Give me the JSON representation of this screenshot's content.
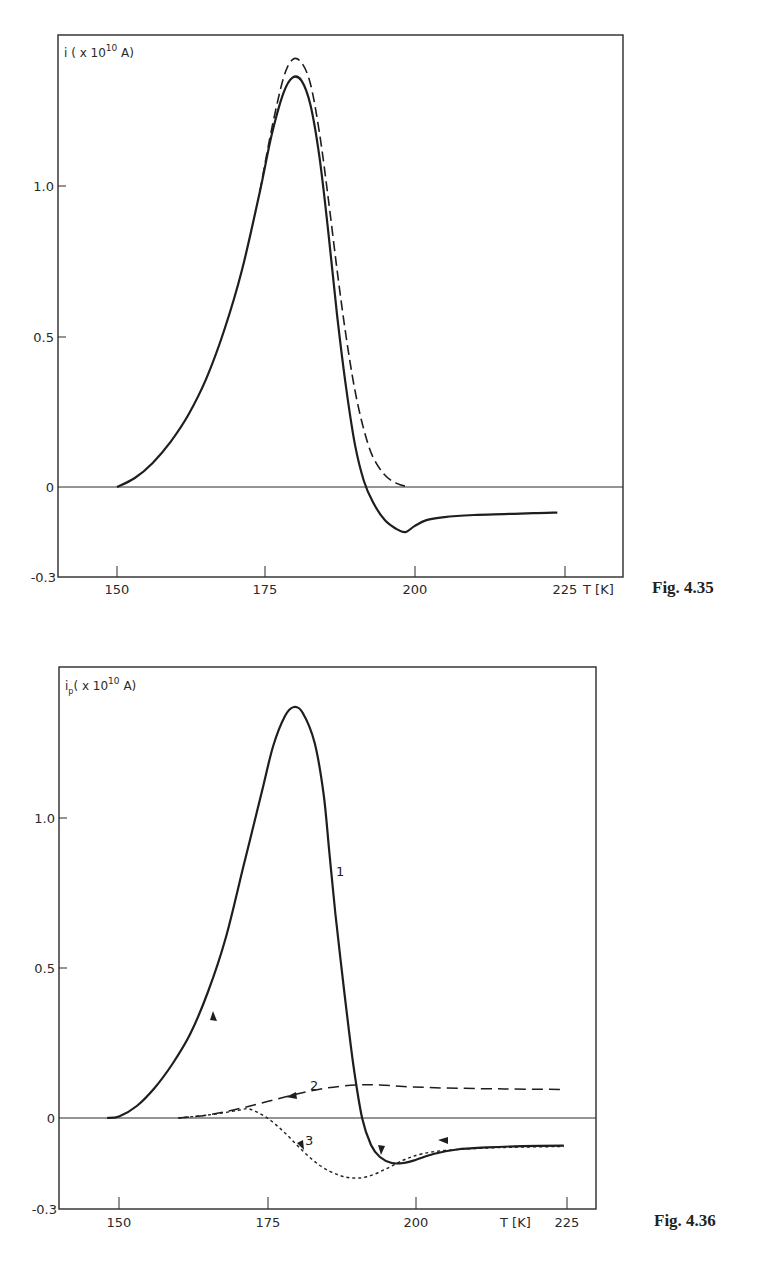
{
  "colors": {
    "ink": "#2a2a2a",
    "background": "#ffffff"
  },
  "chart_data": [
    {
      "type": "line",
      "caption": "Fig. 4.35",
      "title": "",
      "ylabel": "i ( x 10^10 A)",
      "ylabel_main": "i ( x 10",
      "ylabel_exp": "10",
      "ylabel_tail": " A)",
      "xlabel": "T [K]",
      "xlim": [
        140,
        228
      ],
      "ylim": [
        -0.3,
        1.5
      ],
      "xticks": [
        "150",
        "175",
        "200",
        "225"
      ],
      "xtick_values": [
        150,
        175,
        200,
        225
      ],
      "yticks": [
        "-0.3",
        "0",
        "0.5",
        "1.0"
      ],
      "ytick_values": [
        -0.3,
        0,
        0.5,
        1.0
      ],
      "zero_line": true,
      "grid": false,
      "series": [
        {
          "name": "solid",
          "style": "solid",
          "points": [
            [
              150,
              0.0
            ],
            [
              153,
              0.03
            ],
            [
              156,
              0.08
            ],
            [
              159,
              0.15
            ],
            [
              162,
              0.24
            ],
            [
              165,
              0.36
            ],
            [
              168,
              0.52
            ],
            [
              171,
              0.72
            ],
            [
              174,
              0.98
            ],
            [
              176,
              1.17
            ],
            [
              178,
              1.31
            ],
            [
              179.5,
              1.36
            ],
            [
              181,
              1.35
            ],
            [
              182.5,
              1.27
            ],
            [
              184,
              1.1
            ],
            [
              185.5,
              0.85
            ],
            [
              187,
              0.57
            ],
            [
              188.5,
              0.33
            ],
            [
              190,
              0.14
            ],
            [
              191.5,
              0.02
            ],
            [
              193,
              -0.05
            ],
            [
              195,
              -0.11
            ],
            [
              197,
              -0.14
            ],
            [
              198.5,
              -0.15
            ],
            [
              200,
              -0.13
            ],
            [
              202,
              -0.11
            ],
            [
              205,
              -0.1
            ],
            [
              210,
              -0.093
            ],
            [
              215,
              -0.09
            ],
            [
              220,
              -0.087
            ],
            [
              224,
              -0.085
            ]
          ]
        },
        {
          "name": "dashed",
          "style": "dashed",
          "points": [
            [
              174,
              0.98
            ],
            [
              176,
              1.19
            ],
            [
              178,
              1.36
            ],
            [
              179.5,
              1.42
            ],
            [
              181,
              1.41
            ],
            [
              182.5,
              1.34
            ],
            [
              184,
              1.18
            ],
            [
              185.5,
              0.96
            ],
            [
              187,
              0.72
            ],
            [
              188.5,
              0.5
            ],
            [
              190,
              0.32
            ],
            [
              191.5,
              0.19
            ],
            [
              193,
              0.1
            ],
            [
              195,
              0.04
            ],
            [
              197,
              0.012
            ],
            [
              199,
              0.0
            ]
          ]
        }
      ]
    },
    {
      "type": "line",
      "caption": "Fig. 4.36",
      "title": "",
      "ylabel": "i_p ( x 10^10 A)",
      "ylabel_main": "i",
      "ylabel_sub": "p",
      "ylabel_mid": "( x 10",
      "ylabel_exp": "10",
      "ylabel_tail": " A)",
      "xlabel": "T [K]",
      "xlim": [
        140,
        230
      ],
      "ylim": [
        -0.3,
        1.5
      ],
      "xticks": [
        "150",
        "175",
        "200",
        "225"
      ],
      "xtick_values": [
        150,
        175,
        200,
        225
      ],
      "yticks": [
        "-0.3",
        "0",
        "0.5",
        "1.0"
      ],
      "ytick_values": [
        -0.3,
        0,
        0.5,
        1.0
      ],
      "zero_line": true,
      "grid": false,
      "series": [
        {
          "name": "1",
          "style": "solid",
          "label_pos": [
            186,
            0.84
          ],
          "points": [
            [
              148,
              0.0
            ],
            [
              150,
              0.005
            ],
            [
              153,
              0.04
            ],
            [
              156,
              0.1
            ],
            [
              159,
              0.18
            ],
            [
              162,
              0.28
            ],
            [
              165,
              0.42
            ],
            [
              168,
              0.6
            ],
            [
              171,
              0.84
            ],
            [
              174,
              1.08
            ],
            [
              176,
              1.24
            ],
            [
              178,
              1.34
            ],
            [
              179.5,
              1.37
            ],
            [
              181,
              1.35
            ],
            [
              183,
              1.25
            ],
            [
              184.5,
              1.08
            ],
            [
              185.5,
              0.88
            ],
            [
              186.5,
              0.68
            ],
            [
              188,
              0.42
            ],
            [
              189.5,
              0.18
            ],
            [
              191,
              0.0
            ],
            [
              192.5,
              -0.09
            ],
            [
              194,
              -0.13
            ],
            [
              196,
              -0.15
            ],
            [
              198,
              -0.15
            ],
            [
              200,
              -0.14
            ],
            [
              203,
              -0.12
            ],
            [
              207,
              -0.105
            ],
            [
              212,
              -0.098
            ],
            [
              218,
              -0.094
            ],
            [
              225,
              -0.092
            ]
          ]
        },
        {
          "name": "2",
          "style": "dashed",
          "label_pos": [
            178,
            0.12
          ],
          "points": [
            [
              160,
              0.0
            ],
            [
              165,
              0.01
            ],
            [
              170,
              0.03
            ],
            [
              175,
              0.055
            ],
            [
              180,
              0.08
            ],
            [
              185,
              0.1
            ],
            [
              190,
              0.11
            ],
            [
              194,
              0.11
            ],
            [
              198,
              0.105
            ],
            [
              205,
              0.1
            ],
            [
              215,
              0.097
            ],
            [
              225,
              0.095
            ]
          ]
        },
        {
          "name": "3",
          "style": "dotted",
          "label_pos": [
            178,
            -0.085
          ],
          "points": [
            [
              160,
              0.0
            ],
            [
              165,
              0.01
            ],
            [
              170,
              0.025
            ],
            [
              172,
              0.03
            ],
            [
              175,
              0.0
            ],
            [
              178,
              -0.05
            ],
            [
              181,
              -0.11
            ],
            [
              184,
              -0.16
            ],
            [
              187,
              -0.19
            ],
            [
              189.5,
              -0.2
            ],
            [
              192,
              -0.195
            ],
            [
              195,
              -0.17
            ],
            [
              198,
              -0.14
            ],
            [
              201,
              -0.12
            ],
            [
              205,
              -0.108
            ],
            [
              212,
              -0.1
            ],
            [
              218,
              -0.097
            ],
            [
              225,
              -0.095
            ]
          ]
        }
      ]
    }
  ],
  "figures": [
    {
      "caption": "Fig. 4.35"
    },
    {
      "caption": "Fig. 4.36"
    }
  ]
}
